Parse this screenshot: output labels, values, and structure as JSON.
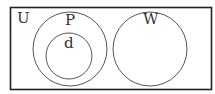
{
  "diagram": {
    "type": "venn",
    "universe_label": "U",
    "sets": [
      {
        "label": "P",
        "contains": [
          "d"
        ]
      },
      {
        "label": "d",
        "subset_of": "P"
      },
      {
        "label": "W",
        "disjoint_from": [
          "P"
        ]
      }
    ],
    "stroke_color": "#444444",
    "border_color": "#222222"
  }
}
